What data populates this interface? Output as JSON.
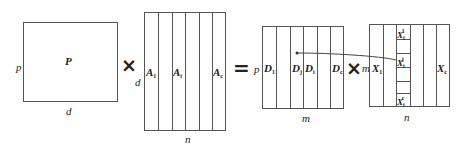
{
  "diagram": {
    "matrix_p": {
      "label": "P",
      "rows_label": "p",
      "cols_label": "d"
    },
    "operator_1": "×",
    "matrix_a": {
      "rows_label": "d",
      "cols_label": "n",
      "columns": [
        {
          "label": "A",
          "sub": "1"
        },
        {
          "label": "A",
          "sub": "i"
        },
        {
          "label": "A",
          "sub": "c"
        }
      ]
    },
    "operator_eq": "=",
    "matrix_d": {
      "rows_label": "p",
      "cols_label": "m",
      "columns": [
        {
          "label": "D",
          "sub": "1"
        },
        {
          "label": "D",
          "sub": "j"
        },
        {
          "label": "D",
          "sub": "i"
        },
        {
          "label": "D",
          "sub": "c"
        }
      ]
    },
    "operator_2": "×",
    "matrix_x": {
      "rows_label": "m",
      "cols_label": "n",
      "columns": [
        {
          "label": "X",
          "sub": "1"
        },
        {
          "label": "X",
          "sub": "c"
        }
      ],
      "cells": [
        {
          "label": "X",
          "sub": "i",
          "sup": "1"
        },
        {
          "label": "X",
          "sub": "i",
          "sup": "j"
        },
        {
          "label": "X",
          "sub": "i",
          "sup": "c"
        }
      ]
    },
    "arrow": {
      "from": "X_i^j",
      "to": "D_j"
    }
  }
}
